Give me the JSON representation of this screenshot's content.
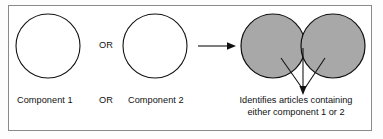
{
  "figure": {
    "frame_border_color": "#8a8a8a",
    "background_color": "#ffffff",
    "line_color": "#111111",
    "shaded_fill_color": "#a8a8a8"
  },
  "left_group": {
    "circle_1": {
      "name": "Component 1 circle",
      "fill": "none",
      "stroke": "#111111"
    },
    "circle_2": {
      "name": "Component 2 circle",
      "fill": "none",
      "stroke": "#111111"
    },
    "operator_top": "OR",
    "labels": {
      "component_1": "Component 1",
      "operator": "OR",
      "component_2": "Component 2"
    }
  },
  "arrow": {
    "name": "result-arrow",
    "direction": "right"
  },
  "result_group": {
    "venn": {
      "left_circle_fill": "#a8a8a8",
      "right_circle_fill": "#a8a8a8",
      "overlap_fill": "#a8a8a8",
      "stroke": "#111111"
    },
    "pointer": {
      "name": "pointer-arrow",
      "direction": "down",
      "leader_count": 3
    },
    "caption_line_1": "Identifies articles containing",
    "caption_line_2": "either component 1 or 2"
  }
}
